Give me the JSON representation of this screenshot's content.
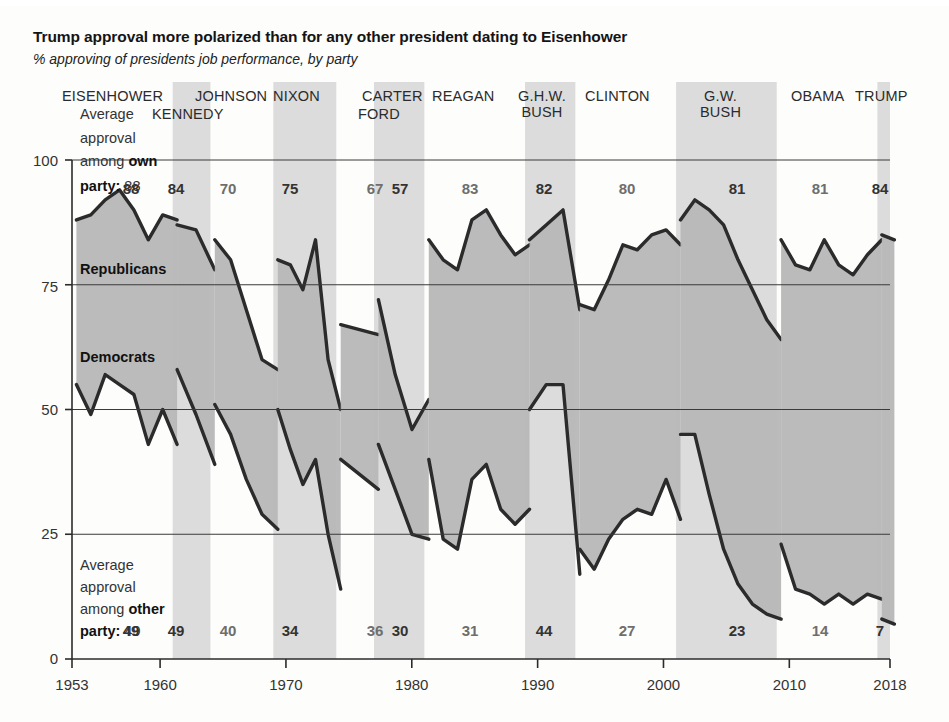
{
  "header": {
    "title": "Trump approval more polarized than for any other president dating to Eisenhower",
    "subtitle": "% approving of presidents job performance, by party"
  },
  "annotations": {
    "top_note_line1": "Average",
    "top_note_line2": "approval",
    "top_note_line3": "among ",
    "top_note_line3_bold": "own",
    "top_note_line4_bold": "party:",
    "top_note_line4_value": "88",
    "bottom_note_line1": "Average",
    "bottom_note_line2": "approval",
    "bottom_note_line3": "among ",
    "bottom_note_line3_bold": "other",
    "bottom_note_line4_bold": "party:",
    "bottom_note_line4_value": "49",
    "series_republicans": "Republicans",
    "series_democrats": "Democrats"
  },
  "chart_data": {
    "type": "area",
    "title": "Trump approval more polarized than for any other president dating to Eisenhower",
    "subtitle": "% approving of presidents job performance, by party",
    "xlabel": "",
    "ylabel": "%",
    "xlim": [
      1953,
      2018
    ],
    "ylim": [
      0,
      100
    ],
    "grid": true,
    "legend_position": "inline",
    "y_ticks": [
      "0",
      "25",
      "50",
      "75",
      "100"
    ],
    "y_tick_values": [
      0,
      25,
      50,
      75,
      100
    ],
    "x_ticks": [
      "1953",
      "1960",
      "1970",
      "1980",
      "1990",
      "2000",
      "2010",
      "2018"
    ],
    "x_tick_values": [
      1953,
      1960,
      1970,
      1980,
      1990,
      2000,
      2010,
      2018
    ],
    "series": [
      {
        "name": "Republicans",
        "color": "#2b2b2b"
      },
      {
        "name": "Democrats",
        "color": "#2b2b2b"
      }
    ],
    "presidents": [
      {
        "name": "EISENHOWER",
        "label_lines": [
          "EISENHOWER"
        ],
        "start": 1953,
        "end": 1961,
        "own_party_avg": 88,
        "other_party_avg": 49,
        "shaded": false,
        "bold_numbers": true,
        "own_party_series": [
          88,
          89,
          92,
          94,
          90,
          84,
          89,
          88
        ],
        "other_party_series": [
          55,
          49,
          57,
          55,
          53,
          43,
          50,
          43
        ]
      },
      {
        "name": "KENNEDY",
        "label_lines": [
          "KENNEDY"
        ],
        "start": 1961,
        "end": 1964,
        "own_party_avg": 84,
        "other_party_avg": 49,
        "shaded": true,
        "bold_numbers": true,
        "own_party_series": [
          87,
          86,
          78
        ],
        "other_party_series": [
          58,
          49,
          39
        ]
      },
      {
        "name": "JOHNSON",
        "label_lines": [
          "JOHNSON"
        ],
        "start": 1964,
        "end": 1969,
        "own_party_avg": 70,
        "other_party_avg": 40,
        "shaded": false,
        "bold_numbers": false,
        "own_party_series": [
          84,
          80,
          70,
          60,
          58
        ],
        "other_party_series": [
          51,
          45,
          36,
          29,
          26
        ]
      },
      {
        "name": "NIXON",
        "label_lines": [
          "NIXON"
        ],
        "start": 1969,
        "end": 1974,
        "own_party_avg": 75,
        "other_party_avg": 34,
        "shaded": true,
        "bold_numbers": true,
        "own_party_series": [
          80,
          79,
          74,
          84,
          60,
          50
        ],
        "other_party_series": [
          50,
          42,
          35,
          40,
          25,
          14
        ]
      },
      {
        "name": "FORD",
        "label_lines": [
          "FORD"
        ],
        "start": 1974,
        "end": 1977,
        "own_party_avg": 67,
        "other_party_avg": 36,
        "shaded": false,
        "bold_numbers": false,
        "own_party_series": [
          67,
          65
        ],
        "other_party_series": [
          40,
          34
        ]
      },
      {
        "name": "CARTER",
        "label_lines": [
          "CARTER"
        ],
        "start": 1977,
        "end": 1981,
        "own_party_avg": 57,
        "other_party_avg": 30,
        "shaded": true,
        "bold_numbers": true,
        "own_party_series": [
          72,
          57,
          46,
          52
        ],
        "other_party_series": [
          43,
          34,
          25,
          24
        ]
      },
      {
        "name": "REAGAN",
        "label_lines": [
          "REAGAN"
        ],
        "start": 1981,
        "end": 1989,
        "own_party_avg": 83,
        "other_party_avg": 31,
        "shaded": false,
        "bold_numbers": false,
        "own_party_series": [
          84,
          80,
          78,
          88,
          90,
          85,
          81,
          83
        ],
        "other_party_series": [
          40,
          24,
          22,
          36,
          39,
          30,
          27,
          30
        ]
      },
      {
        "name": "G.H.W. BUSH",
        "label_lines": [
          "G.H.W.",
          "BUSH"
        ],
        "start": 1989,
        "end": 1993,
        "own_party_avg": 82,
        "other_party_avg": 44,
        "shaded": true,
        "bold_numbers": true,
        "own_party_series": [
          84,
          87,
          90,
          70
        ],
        "other_party_series": [
          50,
          55,
          55,
          17
        ]
      },
      {
        "name": "CLINTON",
        "label_lines": [
          "CLINTON"
        ],
        "start": 1993,
        "end": 2001,
        "own_party_avg": 80,
        "other_party_avg": 27,
        "shaded": false,
        "bold_numbers": false,
        "own_party_series": [
          71,
          70,
          76,
          83,
          82,
          85,
          86,
          83
        ],
        "other_party_series": [
          22,
          18,
          24,
          28,
          30,
          29,
          36,
          28
        ]
      },
      {
        "name": "G.W. BUSH",
        "label_lines": [
          "G.W.",
          "BUSH"
        ],
        "start": 2001,
        "end": 2009,
        "own_party_avg": 81,
        "other_party_avg": 23,
        "shaded": true,
        "bold_numbers": true,
        "own_party_series": [
          88,
          92,
          90,
          87,
          80,
          74,
          68,
          64
        ],
        "other_party_series": [
          45,
          45,
          33,
          22,
          15,
          11,
          9,
          8
        ]
      },
      {
        "name": "OBAMA",
        "label_lines": [
          "OBAMA"
        ],
        "start": 2009,
        "end": 2017,
        "own_party_avg": 81,
        "other_party_avg": 14,
        "shaded": false,
        "bold_numbers": false,
        "own_party_series": [
          84,
          79,
          78,
          84,
          79,
          77,
          81,
          84
        ],
        "other_party_series": [
          23,
          14,
          13,
          11,
          13,
          11,
          13,
          12
        ]
      },
      {
        "name": "TRUMP",
        "label_lines": [
          "TRUMP"
        ],
        "start": 2017,
        "end": 2018,
        "own_party_avg": 84,
        "other_party_avg": 7,
        "shaded": true,
        "bold_numbers": true,
        "own_party_series": [
          85,
          84
        ],
        "other_party_series": [
          8,
          7
        ]
      }
    ]
  }
}
